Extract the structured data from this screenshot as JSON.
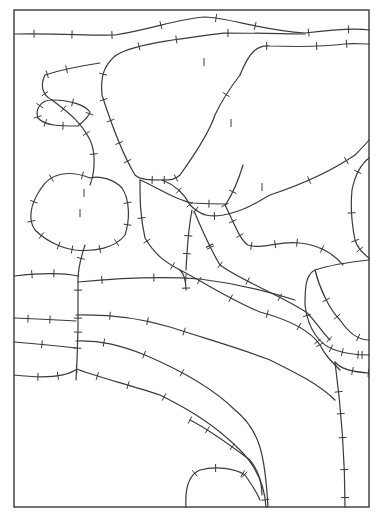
{
  "diagram": {
    "type": "line drawing of curved paths with perpendicular tick marks inside a rectangular frame",
    "frame": {
      "x": 14,
      "y": 10,
      "width": 355,
      "height": 497
    },
    "stroke_color": "#3a3a3a",
    "background": "#ffffff",
    "caption": "",
    "curves": [
      {
        "id": "top-1",
        "d": "M14 34 C60 33 90 36 115 35 C150 30 180 18 205 17 C230 18 260 30 305 33 C330 30 355 28 369 30"
      },
      {
        "id": "top-2",
        "d": "M115 56 C130 45 170 40 225 33 C260 33 290 34 305 34"
      },
      {
        "id": "top-3",
        "d": "M240 75 C250 50 258 45 270 46 C300 47 330 46 345 44 C352 43 360 44 369 44"
      },
      {
        "id": "big-shape-left",
        "d": "M115 56 C105 65 100 75 102 95 C110 120 120 150 135 175 C140 180 150 180 162 180"
      },
      {
        "id": "big-shape-right",
        "d": "M240 75 C230 88 222 100 215 115 C210 130 198 150 180 175 C175 180 170 180 162 180"
      },
      {
        "id": "hook-outer",
        "d": "M100 63 C80 66 60 70 45 75 C40 85 42 95 52 100 C65 110 80 120 90 140 C95 150 96 170 90 185"
      },
      {
        "id": "hook-loop",
        "d": "M52 100 C40 100 35 110 38 118 C45 126 60 126 78 126 C85 120 90 115 90 112 C85 105 70 100 52 100"
      },
      {
        "id": "left-loop",
        "d": "M90 178 C70 170 50 172 40 190 C30 205 28 220 35 230 C45 240 60 248 75 250 C95 252 115 248 125 235 C130 220 130 200 122 188 C115 180 100 175 90 178"
      },
      {
        "id": "vertical-stem",
        "d": "M85 245 C82 255 78 265 78 280 L78 330 L77 360 L76 380"
      },
      {
        "id": "mid-diagonal-1",
        "d": "M162 180 C175 185 185 195 190 205 C200 215 210 220 235 212 C250 208 260 200 270 195 C300 185 330 172 355 155 C360 150 365 145 369 140"
      },
      {
        "id": "mid-right-arc",
        "d": "M369 158 C360 165 355 175 352 190 C350 210 353 230 355 240 C358 250 365 255 369 258"
      },
      {
        "id": "inner-box-top",
        "d": "M140 180 C155 186 175 200 192 203 C210 204 225 204 226 204"
      },
      {
        "id": "inner-branch",
        "d": "M226 204 C235 190 240 175 243 165"
      },
      {
        "id": "inner-left-down",
        "d": "M140 180 C140 200 140 215 145 238 C155 255 165 262 180 270 C185 275 186 285 186 290"
      },
      {
        "id": "inner-mid-down",
        "d": "M192 210 C188 230 187 250 186 270"
      },
      {
        "id": "inner-right-down",
        "d": "M225 205 C235 225 240 240 248 245 C262 250 280 240 300 243 C320 245 335 255 343 265"
      },
      {
        "id": "diag-band-1",
        "d": "M194 211 C200 225 208 245 220 265 C240 280 280 295 306 312 C315 320 320 330 330 340"
      },
      {
        "id": "diag-band-2",
        "d": "M180 270 C200 280 230 300 260 312 C290 320 310 330 320 345 C325 355 330 360 340 370"
      },
      {
        "id": "right-lobe",
        "d": "M369 260 C350 262 330 265 315 270 C305 275 305 290 305 305 C308 330 320 345 335 350 C350 355 360 355 369 355"
      },
      {
        "id": "right-lobe-inner",
        "d": "M315 270 C320 290 330 310 340 320 C350 335 360 340 369 340"
      },
      {
        "id": "horizontal-band-1",
        "d": "M14 276 C40 273 60 272 78 276"
      },
      {
        "id": "horizontal-band-2",
        "d": "M78 282 C120 278 160 276 200 279 C240 284 270 292 295 300"
      },
      {
        "id": "horizontal-band-3",
        "d": "M14 318 C40 319 60 320 76 321"
      },
      {
        "id": "horizontal-band-4",
        "d": "M76 315 C110 314 140 318 170 327 C210 340 245 350 270 360 C300 375 320 385 335 400"
      },
      {
        "id": "horizontal-band-5",
        "d": "M14 342 C40 344 60 346 76 348"
      },
      {
        "id": "horizontal-band-6",
        "d": "M76 341 C100 340 120 345 145 355 C180 370 215 390 235 410 C260 430 265 455 268 507"
      },
      {
        "id": "bottom-arc-outer",
        "d": "M14 375 C40 378 65 378 77 369 C90 375 130 385 160 395 C190 410 215 425 240 450 C260 470 265 490 266 507"
      },
      {
        "id": "bottom-arc-inner",
        "d": "M190 420 C210 430 230 445 250 460 C258 470 262 480 262 495"
      },
      {
        "id": "bottom-small-arch",
        "d": "M186 507 C185 490 188 475 200 470 C215 466 235 468 245 475 C252 485 258 495 260 500"
      },
      {
        "id": "right-vertical",
        "d": "M335 362 C340 400 345 450 345 507"
      },
      {
        "id": "right-bottom-hook",
        "d": "M335 362 C340 368 350 372 369 373"
      }
    ],
    "ticks": [
      [
        33,
        34
      ],
      [
        72,
        35
      ],
      [
        112,
        35
      ],
      [
        162,
        27
      ],
      [
        216,
        19
      ],
      [
        255,
        26
      ],
      [
        308,
        33
      ],
      [
        348,
        28
      ],
      [
        137,
        42
      ],
      [
        177,
        38
      ],
      [
        227,
        33
      ],
      [
        267,
        46
      ],
      [
        317,
        46
      ],
      [
        347,
        44
      ],
      [
        106,
        75
      ],
      [
        110,
        97
      ],
      [
        118,
        117
      ],
      [
        125,
        140
      ],
      [
        130,
        160
      ],
      [
        204,
        62
      ],
      [
        220,
        90
      ],
      [
        231,
        123
      ],
      [
        175,
        176
      ],
      [
        66,
        68
      ],
      [
        46,
        73
      ],
      [
        47,
        92
      ],
      [
        65,
        107
      ],
      [
        80,
        137
      ],
      [
        86,
        155
      ],
      [
        84,
        170
      ],
      [
        41,
        106
      ],
      [
        37,
        118
      ],
      [
        45,
        126
      ],
      [
        62,
        126
      ],
      [
        73,
        102
      ],
      [
        88,
        113
      ],
      [
        48,
        174
      ],
      [
        36,
        203
      ],
      [
        30,
        222
      ],
      [
        40,
        237
      ],
      [
        60,
        243
      ],
      [
        73,
        249
      ],
      [
        100,
        248
      ],
      [
        116,
        241
      ],
      [
        127,
        202
      ],
      [
        125,
        224
      ],
      [
        84,
        193
      ],
      [
        80,
        213
      ],
      [
        80,
        258
      ],
      [
        78,
        290
      ],
      [
        77,
        318
      ],
      [
        78,
        333
      ],
      [
        196,
        210
      ],
      [
        215,
        211
      ],
      [
        240,
        195
      ],
      [
        262,
        187
      ],
      [
        307,
        176
      ],
      [
        345,
        159
      ],
      [
        356,
        172
      ],
      [
        357,
        213
      ],
      [
        354,
        242
      ],
      [
        359,
        250
      ],
      [
        152,
        180
      ],
      [
        165,
        180
      ],
      [
        178,
        190
      ],
      [
        188,
        206
      ],
      [
        209,
        204
      ],
      [
        225,
        205
      ],
      [
        143,
        218
      ],
      [
        150,
        240
      ],
      [
        172,
        268
      ],
      [
        186,
        278
      ],
      [
        189,
        235
      ],
      [
        188,
        253
      ],
      [
        205,
        247
      ],
      [
        210,
        248
      ],
      [
        236,
        220
      ],
      [
        241,
        236
      ],
      [
        252,
        247
      ],
      [
        275,
        243
      ],
      [
        297,
        241
      ],
      [
        322,
        250
      ],
      [
        205,
        248
      ],
      [
        221,
        265
      ],
      [
        247,
        283
      ],
      [
        279,
        297
      ],
      [
        306,
        315
      ],
      [
        190,
        287
      ],
      [
        229,
        300
      ],
      [
        266,
        317
      ],
      [
        297,
        330
      ],
      [
        319,
        345
      ],
      [
        31,
        275
      ],
      [
        53,
        272
      ],
      [
        102,
        279
      ],
      [
        154,
        277
      ],
      [
        199,
        280
      ],
      [
        29,
        318
      ],
      [
        50,
        321
      ],
      [
        111,
        315
      ],
      [
        147,
        323
      ],
      [
        184,
        334
      ],
      [
        42,
        343
      ],
      [
        78,
        349
      ],
      [
        103,
        342
      ],
      [
        144,
        354
      ],
      [
        182,
        374
      ],
      [
        37,
        376
      ],
      [
        58,
        376
      ],
      [
        77,
        369
      ],
      [
        97,
        375
      ],
      [
        128,
        386
      ],
      [
        165,
        396
      ],
      [
        182,
        418
      ],
      [
        205,
        432
      ],
      [
        229,
        451
      ],
      [
        248,
        472
      ],
      [
        264,
        499
      ],
      [
        196,
        475
      ],
      [
        216,
        469
      ],
      [
        243,
        474
      ],
      [
        320,
        302
      ],
      [
        316,
        342
      ],
      [
        333,
        345
      ],
      [
        342,
        356
      ],
      [
        358,
        357
      ],
      [
        330,
        323
      ],
      [
        338,
        341
      ],
      [
        357,
        340
      ],
      [
        363,
        353
      ],
      [
        340,
        392
      ],
      [
        340,
        414
      ],
      [
        341,
        438
      ],
      [
        344,
        470
      ],
      [
        345,
        497
      ],
      [
        352,
        370
      ],
      [
        368,
        373
      ]
    ]
  }
}
